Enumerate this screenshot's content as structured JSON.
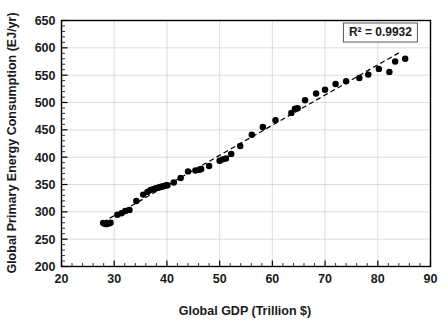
{
  "chart_data": {
    "type": "scatter",
    "title": "",
    "xlabel": "Global GDP (Trillion $)",
    "ylabel": "Global Primary Energy Consumption (EJ/yr)",
    "xlim": [
      20,
      90
    ],
    "ylim": [
      200,
      650
    ],
    "x_major_step": 10,
    "x_minor_step": 2,
    "y_major_step": 50,
    "y_minor_step": 10,
    "x_ticks": [
      20,
      30,
      40,
      50,
      60,
      70,
      80,
      90
    ],
    "y_ticks": [
      200,
      250,
      300,
      350,
      400,
      450,
      500,
      550,
      600,
      650
    ],
    "grid": "major-xy",
    "legend": "none",
    "marker": {
      "shape": "circle",
      "color": "#000000",
      "size": 5
    },
    "annotations": [
      {
        "name": "r-squared",
        "text": "R² = 0.9932",
        "x": 80.5,
        "y": 628,
        "boxed": true
      }
    ],
    "trendline": {
      "type": "linear-dashed",
      "color": "#000000",
      "style": "dashed",
      "r_squared": 0.9932,
      "x_start": 27.8,
      "y_start": 281,
      "x_end": 84.4,
      "y_end": 593
    },
    "series": [
      {
        "name": "Global GDP vs Primary Energy Consumption",
        "points": [
          [
            27.9,
            279.5
          ],
          [
            28.2,
            278.0
          ],
          [
            28.5,
            277.5
          ],
          [
            28.7,
            279.0
          ],
          [
            29.0,
            278.5
          ],
          [
            29.3,
            280.0
          ],
          [
            30.6,
            294.5
          ],
          [
            31.4,
            297.5
          ],
          [
            32.1,
            301.5
          ],
          [
            32.9,
            303.5
          ],
          [
            34.2,
            320.0
          ],
          [
            35.5,
            331.5
          ],
          [
            36.3,
            336.5
          ],
          [
            36.9,
            340.0
          ],
          [
            37.4,
            341.5
          ],
          [
            37.9,
            343.0
          ],
          [
            38.3,
            344.0
          ],
          [
            38.6,
            345.0
          ],
          [
            38.9,
            346.0
          ],
          [
            39.2,
            346.5
          ],
          [
            39.5,
            347.5
          ],
          [
            39.8,
            348.0
          ],
          [
            40.1,
            348.5
          ],
          [
            41.3,
            353.5
          ],
          [
            42.6,
            362.0
          ],
          [
            44.0,
            374.0
          ],
          [
            45.4,
            375.5
          ],
          [
            46.2,
            377.0
          ],
          [
            46.5,
            378.5
          ],
          [
            48.0,
            384.0
          ],
          [
            50.0,
            393.5
          ],
          [
            50.6,
            396.0
          ],
          [
            51.2,
            397.5
          ],
          [
            52.2,
            406.0
          ],
          [
            53.9,
            420.5
          ],
          [
            56.1,
            441.0
          ],
          [
            58.2,
            455.0
          ],
          [
            60.6,
            467.5
          ],
          [
            63.6,
            481.0
          ],
          [
            64.3,
            488.5
          ],
          [
            64.8,
            489.5
          ],
          [
            66.2,
            504.0
          ],
          [
            68.3,
            516.5
          ],
          [
            70.0,
            523.5
          ],
          [
            72.0,
            534.0
          ],
          [
            74.0,
            539.0
          ],
          [
            76.5,
            545.0
          ],
          [
            78.2,
            551.0
          ],
          [
            80.2,
            561.5
          ],
          [
            82.2,
            556.0
          ],
          [
            83.3,
            575.0
          ],
          [
            85.2,
            580.0
          ]
        ]
      }
    ]
  }
}
